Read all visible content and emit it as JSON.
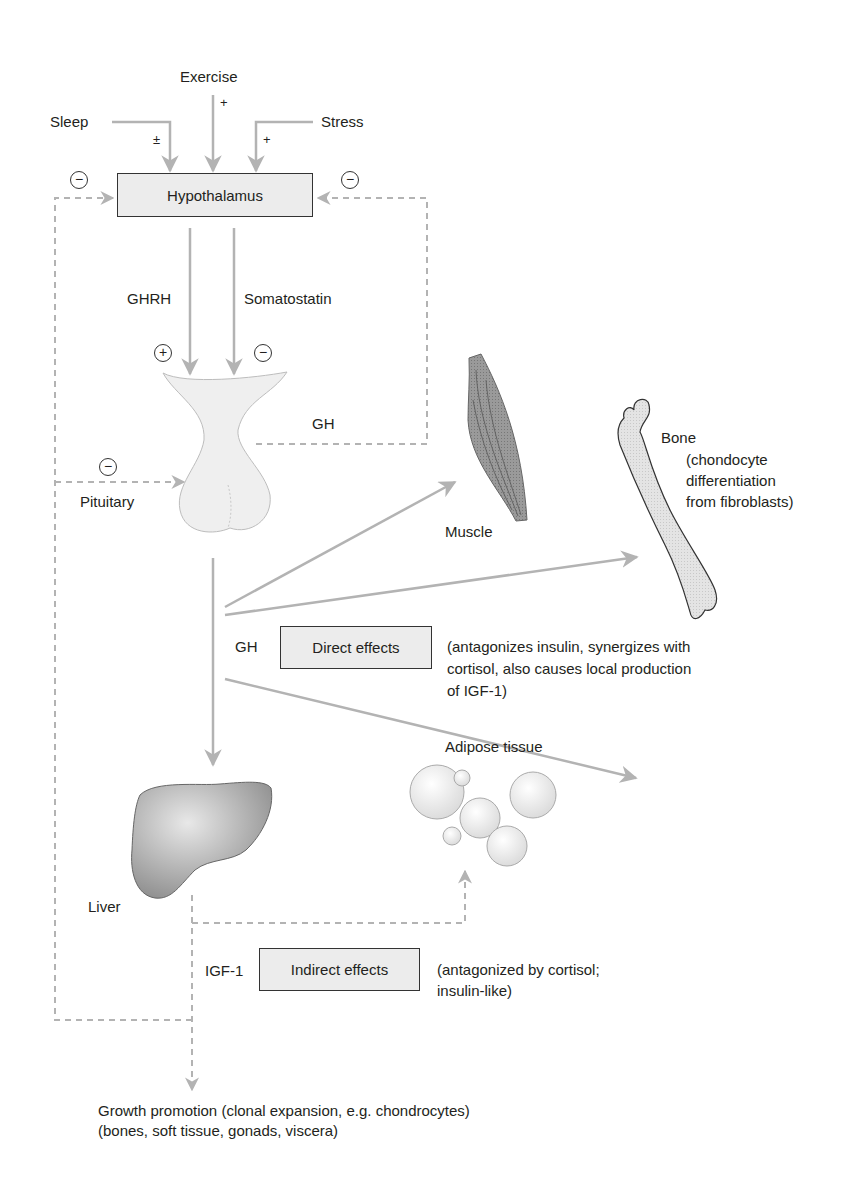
{
  "diagram": {
    "inputs": {
      "exercise": {
        "label": "Exercise",
        "effect": "+"
      },
      "sleep": {
        "label": "Sleep",
        "effect": "±"
      },
      "stress": {
        "label": "Stress",
        "effect": "+"
      }
    },
    "hypothalamus": {
      "label": "Hypothalamus",
      "feedback_left": "−",
      "feedback_right": "−"
    },
    "hormones": {
      "ghrh": {
        "label": "GHRH",
        "effect": "+"
      },
      "somatostatin": {
        "label": "Somatostatin",
        "effect": "−"
      },
      "gh_feedback": "GH"
    },
    "pituitary": {
      "label": "Pituitary",
      "feedback": "−"
    },
    "targets": {
      "muscle": {
        "label": "Muscle"
      },
      "bone": {
        "label": "Bone",
        "note_lines": [
          "(chondocyte",
          "differentiation",
          "from fibroblasts)"
        ]
      },
      "adipose": {
        "label": "Adipose tissue"
      },
      "liver": {
        "label": "Liver"
      }
    },
    "direct": {
      "hormone": "GH",
      "box_label": "Direct effects",
      "note_lines": [
        "(antagonizes insulin, synergizes with",
        "cortisol, also causes local production",
        "of IGF-1)"
      ]
    },
    "indirect": {
      "hormone": "IGF-1",
      "box_label": "Indirect effects",
      "note_lines": [
        "(antagonized by cortisol;",
        "insulin-like)"
      ]
    },
    "outcome": {
      "lines": [
        "Growth promotion (clonal expansion, e.g. chondrocytes)",
        "(bones, soft tissue, gonads, viscera)"
      ]
    },
    "colors": {
      "arrow": "#b3b3b3",
      "dashed": "#b3b3b3",
      "box_fill": "#ececec",
      "text": "#231f20"
    }
  }
}
